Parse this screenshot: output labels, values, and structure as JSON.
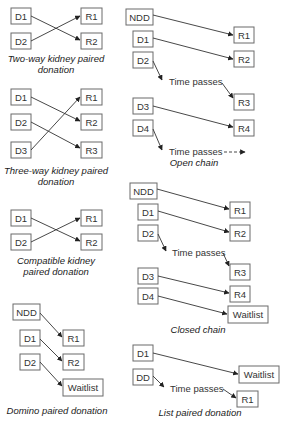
{
  "two_way": {
    "donors": [
      "D1",
      "D2"
    ],
    "recipients": [
      "R1",
      "R2"
    ],
    "caption_line1": "Two-way kidney paired",
    "caption_line2": "donation"
  },
  "three_way": {
    "donors": [
      "D1",
      "D2",
      "D3"
    ],
    "recipients": [
      "R1",
      "R2",
      "R3"
    ],
    "caption_line1": "Three-way kidney paired",
    "caption_line2": "donation"
  },
  "compatible": {
    "donors": [
      "D1",
      "D2"
    ],
    "recipients": [
      "R1",
      "R2"
    ],
    "caption_line1": "Compatible kidney",
    "caption_line2": "paired donation"
  },
  "domino": {
    "donors": [
      "NDD",
      "D1",
      "D2"
    ],
    "recipients": [
      "R1",
      "R2",
      "Waitlist"
    ],
    "caption": "Domino paired donation"
  },
  "open_chain": {
    "donors": [
      "NDD",
      "D1",
      "D2",
      "D3",
      "D4"
    ],
    "recipients": [
      "R1",
      "R2",
      "R3",
      "R4"
    ],
    "time_passes_1": "Time passes",
    "time_passes_2": "Time passes",
    "caption": "Open chain"
  },
  "closed_chain": {
    "donors": [
      "NDD",
      "D1",
      "D2",
      "D3",
      "D4"
    ],
    "recipients": [
      "R1",
      "R2",
      "R3",
      "R4",
      "Waitlist"
    ],
    "time_passes": "Time passes",
    "caption": "Closed chain"
  },
  "list_paired": {
    "donors": [
      "D1",
      "DD"
    ],
    "recipients": [
      "Waitlist",
      "R1"
    ],
    "time_passes": "Time passes",
    "caption": "List paired donation"
  }
}
